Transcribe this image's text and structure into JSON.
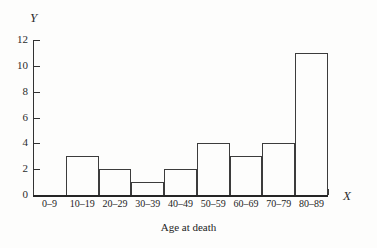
{
  "chart_data": {
    "type": "bar",
    "title": "",
    "subtitle": "",
    "xlabel": "X",
    "ylabel": "Y",
    "caption": "Age at death",
    "categories": [
      "0–9",
      "10–19",
      "20–29",
      "30–39",
      "40–49",
      "50–59",
      "60–69",
      "70–79",
      "80–89"
    ],
    "values": [
      0,
      3,
      2,
      1,
      2,
      4,
      3,
      4,
      11
    ],
    "ylim": [
      0,
      12
    ],
    "y_ticks": [
      0,
      2,
      4,
      6,
      8,
      10,
      12
    ],
    "y_tick_labels": [
      "0",
      "2",
      "4",
      "6",
      "8",
      "10",
      "12"
    ],
    "grid": false,
    "legend": null,
    "legend_position": "none",
    "bar_style": "outline",
    "axis_color": "#323232",
    "bar_edge_color": "#3c3c3c",
    "background_color": "#fdfdfc"
  },
  "axes": {
    "y_axis_label": "Y",
    "x_axis_label": "X"
  },
  "figure": {
    "caption": "Age at death"
  }
}
